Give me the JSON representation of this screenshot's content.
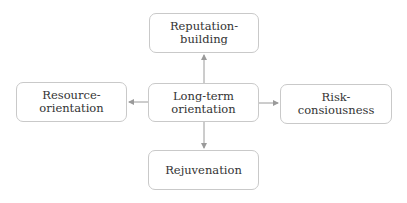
{
  "diagram": {
    "center": {
      "label": "Long-term orientation",
      "line1": "Long-term",
      "line2": "orientation"
    },
    "top": {
      "line1": "Reputation-",
      "line2": "building"
    },
    "left": {
      "line1": "Resource-",
      "line2": "orientation"
    },
    "right": {
      "line1": "Risk-",
      "line2": "consiousness"
    },
    "bottom": {
      "line1": "Rejuvenation"
    },
    "colors": {
      "border": "#c9c9c9",
      "arrow": "#9a9a9a",
      "text": "#333333"
    }
  }
}
